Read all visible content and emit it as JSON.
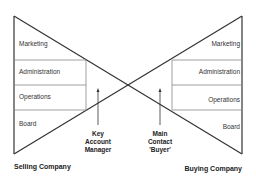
{
  "diagram": {
    "type": "bow-tie relationship diagram",
    "left": {
      "company_label": "Selling Company",
      "layers": [
        "Marketing",
        "Administration",
        "Operations",
        "Board"
      ],
      "contact_label_lines": [
        "Key",
        "Account",
        "Manager"
      ]
    },
    "right": {
      "company_label": "Buying Company",
      "layers": [
        "Marketing",
        "Administration",
        "Operations",
        "Board"
      ],
      "contact_label_lines": [
        "Main",
        "Contact",
        "'Buyer'"
      ]
    },
    "colors": {
      "line": "#333333",
      "divider": "#777777",
      "text": "#333333"
    }
  }
}
